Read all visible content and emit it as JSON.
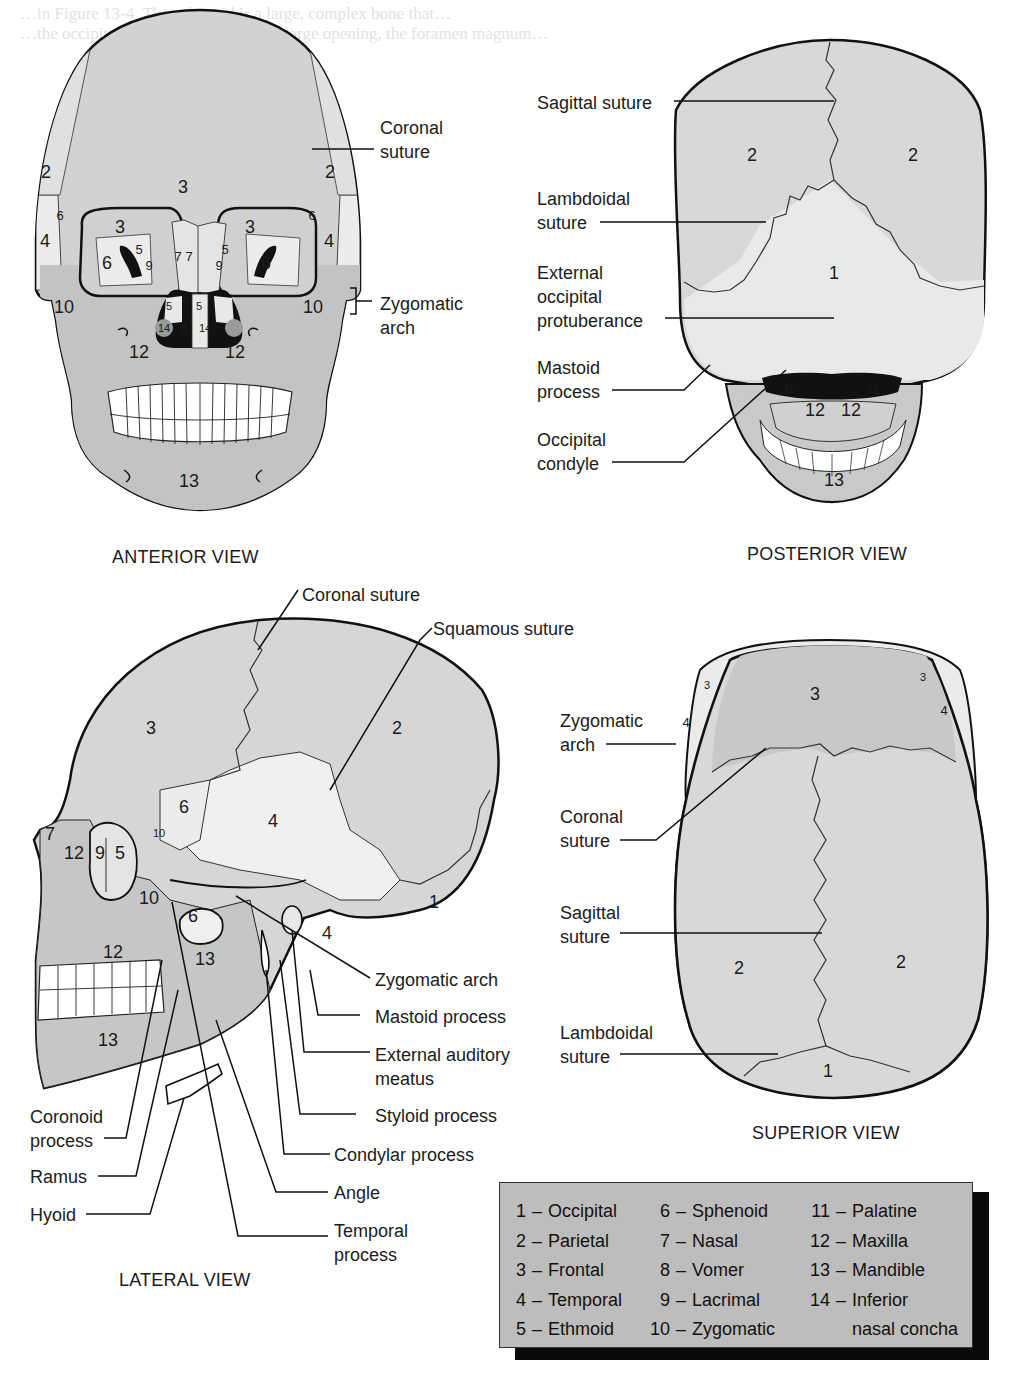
{
  "background_text": {
    "line1": "…in Figure 13-4. The sphenoid is a large, complex bone that…",
    "line2": "…the occipital bone is perforated by a large opening, the foramen magnum…"
  },
  "views": {
    "anterior": {
      "title": "ANTERIOR VIEW",
      "callouts": [
        "Coronal suture",
        "Zygomatic arch"
      ],
      "callout_lines": {
        "coronal": [
          "Coronal",
          "suture"
        ],
        "zygomatic": [
          "Zygomatic",
          "arch"
        ]
      },
      "bone_numbers": {
        "frontal_center": "3",
        "parietal_l": "2",
        "parietal_r": "2",
        "sphenoid_l_small": "6",
        "sphenoid_r_small": "6",
        "temporal_l": "4",
        "temporal_r": "4",
        "orbit_frontal_l": "3",
        "orbit_frontal_r": "3",
        "orbit_sphenoid_l": "6",
        "orbit_sphenoid_r": "6",
        "orbit_ethmoid_l": "5",
        "orbit_ethmoid_r": "5",
        "orbit_lacrimal_l": "9",
        "orbit_lacrimal_r": "9",
        "nasal_l": "7",
        "nasal_r": "7",
        "nasal_ethmoid_l": "5",
        "nasal_ethmoid_c": "5",
        "nasal_ethmoid_r": "5",
        "concha_l": "14",
        "vomer": "8",
        "concha_r": "14",
        "zygomatic_l": "10",
        "zygomatic_r": "10",
        "maxilla_l": "12",
        "maxilla_r": "12",
        "mandible": "13"
      }
    },
    "posterior": {
      "title": "POSTERIOR VIEW",
      "callouts": [
        {
          "lines": [
            "Sagittal suture"
          ]
        },
        {
          "lines": [
            "Lambdoidal",
            "suture"
          ]
        },
        {
          "lines": [
            "External",
            "occipital",
            "protuberance"
          ]
        },
        {
          "lines": [
            "Mastoid",
            "process"
          ]
        },
        {
          "lines": [
            "Occipital",
            "condyle"
          ]
        }
      ],
      "bone_numbers": {
        "parietal_l": "2",
        "parietal_r": "2",
        "occipital": "1",
        "palatine_l": "11",
        "palatine_r": "11",
        "maxilla_l": "12",
        "maxilla_r": "12",
        "mandible": "13"
      }
    },
    "lateral": {
      "title": "LATERAL VIEW",
      "callouts_top": [
        {
          "lines": [
            "Coronal suture"
          ]
        },
        {
          "lines": [
            "Squamous suture"
          ]
        }
      ],
      "callouts_right": [
        {
          "lines": [
            "Zygomatic arch"
          ]
        },
        {
          "lines": [
            "Mastoid process"
          ]
        },
        {
          "lines": [
            "External auditory",
            "meatus"
          ]
        },
        {
          "lines": [
            "Styloid process"
          ]
        },
        {
          "lines": [
            "Condylar process"
          ]
        },
        {
          "lines": [
            "Angle"
          ]
        },
        {
          "lines": [
            "Temporal",
            "process"
          ]
        }
      ],
      "callouts_left": [
        {
          "lines": [
            "Coronoid",
            "process"
          ]
        },
        {
          "lines": [
            "Ramus"
          ]
        },
        {
          "lines": [
            "Hyoid"
          ]
        }
      ],
      "bone_numbers": {
        "frontal": "3",
        "parietal": "2",
        "sphenoid_upper": "6",
        "temporal": "4",
        "nasal": "7",
        "maxilla_upper": "12",
        "lacrimal": "9",
        "ethmoid": "5",
        "zygomatic_small": "10",
        "zygomatic": "10",
        "sphenoid_lower": "6",
        "occipital": "1",
        "temporal_mastoid": "4",
        "maxilla_lower": "12",
        "mandible_ramus": "13",
        "mandible_body": "13"
      }
    },
    "superior": {
      "title": "SUPERIOR VIEW",
      "callouts": [
        {
          "lines": [
            "Zygomatic",
            "arch"
          ]
        },
        {
          "lines": [
            "Coronal",
            "suture"
          ]
        },
        {
          "lines": [
            "Sagittal",
            "suture"
          ]
        },
        {
          "lines": [
            "Lambdoidal",
            "suture"
          ]
        }
      ],
      "bone_numbers": {
        "frontal": "3",
        "frontal_small_l": "3",
        "frontal_small_r": "3",
        "temporal_l": "4",
        "temporal_r": "4",
        "parietal_l": "2",
        "parietal_r": "2",
        "occipital": "1"
      }
    }
  },
  "legend": {
    "columns": [
      [
        {
          "n": "1",
          "name": "Occipital"
        },
        {
          "n": "2",
          "name": "Parietal"
        },
        {
          "n": "3",
          "name": "Frontal"
        },
        {
          "n": "4",
          "name": "Temporal"
        },
        {
          "n": "5",
          "name": "Ethmoid"
        }
      ],
      [
        {
          "n": "6",
          "name": "Sphenoid"
        },
        {
          "n": "7",
          "name": "Nasal"
        },
        {
          "n": "8",
          "name": "Vomer"
        },
        {
          "n": "9",
          "name": "Lacrimal"
        },
        {
          "n": "10",
          "name": "Zygomatic"
        }
      ],
      [
        {
          "n": "11",
          "name": "Palatine"
        },
        {
          "n": "12",
          "name": "Maxilla"
        },
        {
          "n": "13",
          "name": "Mandible"
        },
        {
          "n": "14",
          "name": "Inferior",
          "cont": "nasal concha"
        }
      ]
    ],
    "dash": "–"
  },
  "colors": {
    "bone_mid": "#cfcfcf",
    "bone_light": "#e6e6e6",
    "bone_dark": "#bdbdbd",
    "outline": "#111111",
    "legend_bg": "#bdbdbd",
    "legend_shadow": "#0a0a0a"
  }
}
